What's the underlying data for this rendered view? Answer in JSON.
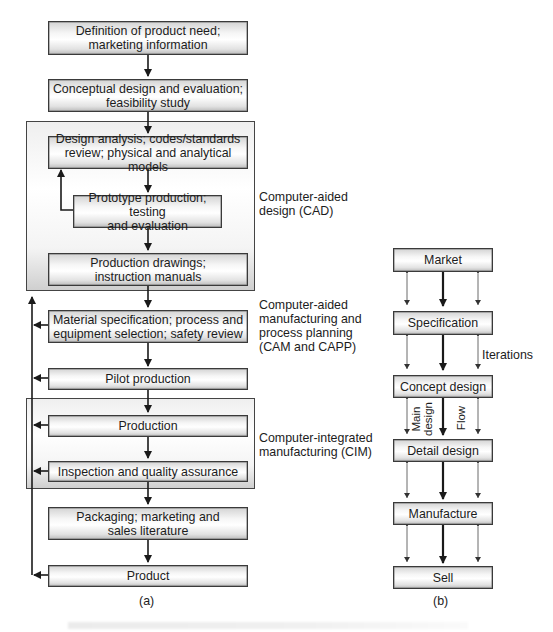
{
  "diagram_a": {
    "label": "(a)",
    "boxes": [
      {
        "id": "need",
        "text": "Definition of product need; marketing information",
        "lines": [
          "Definition of product need;",
          "marketing information"
        ]
      },
      {
        "id": "conceptual",
        "text": "Conceptual design and evaluation; feasibility study",
        "lines": [
          "Conceptual design and evaluation;",
          "feasibility study"
        ]
      },
      {
        "id": "analysis",
        "text": "Design analysis; codes/standards review; physical and analytical models",
        "lines": [
          "Design analysis; codes/standards",
          "review; physical and analytical models"
        ]
      },
      {
        "id": "prototype",
        "text": "Prototype production; testing and evaluation",
        "lines": [
          "Prototype production; testing",
          "and evaluation"
        ]
      },
      {
        "id": "drawings",
        "text": "Production drawings; instruction manuals",
        "lines": [
          "Production drawings;",
          "instruction manuals"
        ]
      },
      {
        "id": "material",
        "text": "Material specification; process and equipment selection; safety review",
        "lines": [
          "Material specification; process and",
          "equipment selection; safety review"
        ]
      },
      {
        "id": "pilot",
        "text": "Pilot production",
        "lines": [
          "Pilot production"
        ]
      },
      {
        "id": "production",
        "text": "Production",
        "lines": [
          "Production"
        ]
      },
      {
        "id": "inspection",
        "text": "Inspection and quality assurance",
        "lines": [
          "Inspection and quality assurance"
        ]
      },
      {
        "id": "packaging",
        "text": "Packaging; marketing and sales literature",
        "lines": [
          "Packaging; marketing and",
          "sales literature"
        ]
      },
      {
        "id": "product",
        "text": "Product",
        "lines": [
          "Product"
        ]
      }
    ],
    "groups": [
      {
        "id": "cad",
        "label_lines": [
          "Computer-aided",
          "design (CAD)"
        ]
      },
      {
        "id": "cim",
        "label_lines": [
          "Computer-integrated",
          "manufacturing (CIM)"
        ]
      }
    ],
    "side_labels": {
      "cam": [
        "Computer-aided",
        "manufacturing and",
        "process planning",
        "(CAM and CAPP)"
      ]
    }
  },
  "diagram_b": {
    "label": "(b)",
    "boxes": [
      "Market",
      "Specification",
      "Concept design",
      "Detail design",
      "Manufacture",
      "Sell"
    ],
    "annotations": {
      "iterations": "Iterations",
      "main_design": [
        "Main",
        "design"
      ],
      "flow": "Flow"
    }
  }
}
